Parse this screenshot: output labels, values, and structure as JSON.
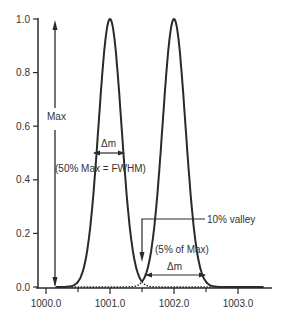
{
  "chart_data": {
    "type": "line",
    "title": "",
    "xlabel": "",
    "ylabel": "",
    "xlim": [
      999.9,
      1003.5
    ],
    "ylim": [
      0.0,
      1.0
    ],
    "grid": false,
    "legend": null,
    "x_ticks": [
      1000.0,
      1001.0,
      1002.0,
      1003.0
    ],
    "x_tick_labels": [
      "1000.0",
      "1001.0",
      "1002.0",
      "1003.0"
    ],
    "x_minor_ticks": [
      1000.5,
      1001.5,
      1002.5
    ],
    "y_ticks": [
      0.0,
      0.2,
      0.4,
      0.6,
      0.8,
      1.0
    ],
    "y_tick_labels": [
      "0.0",
      "0.2",
      "0.4",
      "0.6",
      "0.8",
      "1.0"
    ],
    "series": [
      {
        "name": "Peak 1",
        "style": "solid",
        "center": 1001.0,
        "height": 1.0,
        "fwhm": 0.42
      },
      {
        "name": "Peak 2",
        "style": "solid",
        "center": 1002.0,
        "height": 1.0,
        "fwhm": 0.42
      },
      {
        "name": "Peak tails (overlap)",
        "style": "dotted",
        "description": "dotted continuation of each peak below the valley"
      }
    ],
    "annotations": [
      {
        "id": "max",
        "text": "Max",
        "type": "double-arrow vertical",
        "x": 1000.2,
        "y_from": 0.0,
        "y_to": 0.98
      },
      {
        "id": "dm_fwhm",
        "text": "Δm",
        "type": "double-arrow horizontal",
        "y": 0.5,
        "x_from": 1000.79,
        "x_to": 1001.21
      },
      {
        "id": "fwhm_label",
        "text": "(50% Max = FWHM)",
        "x": 1000.6,
        "y": 0.45
      },
      {
        "id": "valley",
        "text": "10% valley",
        "type": "bracket",
        "y": 0.13
      },
      {
        "id": "five_pct",
        "text": "(5% of Max)",
        "x": 1001.75,
        "y": 0.08
      },
      {
        "id": "dm_valley",
        "text": "Δm",
        "type": "double-arrow horizontal",
        "y": 0.04,
        "x_from": 1001.5,
        "x_to": 1002.5
      }
    ]
  },
  "labels": {
    "max": "Max",
    "dm1": "Δm",
    "fwhm": "(50% Max = FWHM)",
    "valley": "10% valley",
    "five": "(5% of Max)",
    "dm2": "Δm"
  },
  "colors": {
    "line": "#2a2a2a",
    "text": "#333333",
    "background": "#ffffff"
  }
}
